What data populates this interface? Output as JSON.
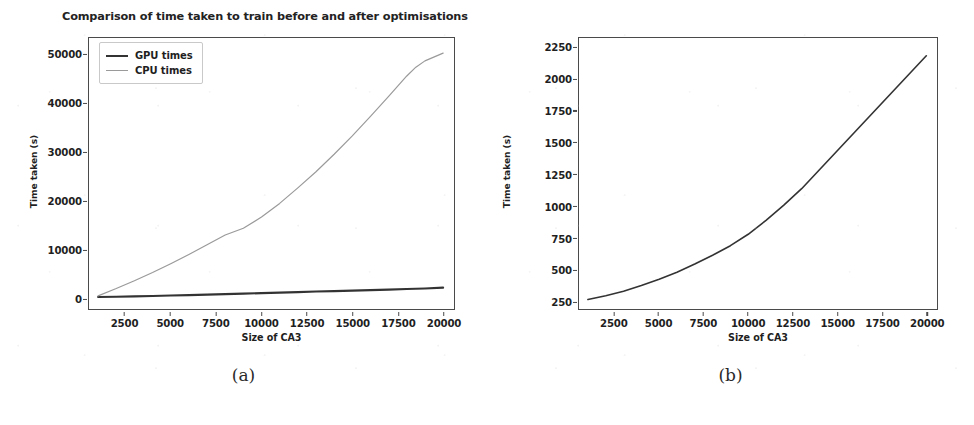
{
  "figure": {
    "background_color": "#ffffff",
    "captions": [
      {
        "id": "a",
        "text": "(a)"
      },
      {
        "id": "b",
        "text": "(b)"
      }
    ]
  },
  "colors": {
    "gpu_line": "#333333",
    "cpu_line": "#9a9a9a",
    "axis": "#4a4a4a",
    "text": "#1f1f1f"
  },
  "chart_data": [
    {
      "panel": "a",
      "type": "line",
      "title": "Comparison of time taken to train before and after optimisations",
      "xlabel": "Size of CA3",
      "ylabel": "Time taken (s)",
      "xlim": [
        500,
        20600
      ],
      "ylim": [
        -2200,
        53500
      ],
      "xticks": [
        2500,
        5000,
        7500,
        10000,
        12500,
        15000,
        17500,
        20000
      ],
      "yticks": [
        0,
        10000,
        20000,
        30000,
        40000,
        50000
      ],
      "xticklabels": [
        "2500",
        "5000",
        "7500",
        "10000",
        "12500",
        "15000",
        "17500",
        "20000"
      ],
      "yticklabels": [
        "0",
        "10000",
        "20000",
        "30000",
        "40000",
        "50000"
      ],
      "grid": false,
      "legend_position": "upper left",
      "x": [
        1000,
        2000,
        3000,
        4000,
        5000,
        6000,
        7000,
        8000,
        9000,
        10000,
        11000,
        12000,
        13000,
        14000,
        15000,
        16000,
        17000,
        18000,
        18500,
        19000,
        20000
      ],
      "series": [
        {
          "name": "GPU times",
          "color": "#333333",
          "linewidth": 2.1,
          "values": [
            260,
            330,
            400,
            470,
            560,
            650,
            750,
            860,
            960,
            1060,
            1170,
            1270,
            1380,
            1480,
            1580,
            1680,
            1790,
            1900,
            1950,
            2020,
            2190
          ]
        },
        {
          "name": "CPU times",
          "color": "#9a9a9a",
          "linewidth": 1.2,
          "values": [
            500,
            2000,
            3600,
            5300,
            7100,
            9000,
            11000,
            13000,
            14400,
            16700,
            19500,
            22700,
            26000,
            29600,
            33400,
            37400,
            41500,
            45700,
            47500,
            48800,
            50400
          ]
        }
      ]
    },
    {
      "panel": "b",
      "type": "line",
      "title": "",
      "xlabel": "Size of CA3",
      "ylabel": "Time taken (s)",
      "xlim": [
        500,
        20600
      ],
      "ylim": [
        190,
        2330
      ],
      "xticks": [
        2500,
        5000,
        7500,
        10000,
        12500,
        15000,
        17500,
        20000
      ],
      "yticks": [
        250,
        500,
        750,
        1000,
        1250,
        1500,
        1750,
        2000,
        2250
      ],
      "xticklabels": [
        "2500",
        "5000",
        "7500",
        "10000",
        "12500",
        "15000",
        "17500",
        "20000"
      ],
      "yticklabels": [
        "250",
        "500",
        "750",
        "1000",
        "1250",
        "1500",
        "1750",
        "2000",
        "2250"
      ],
      "grid": false,
      "legend_position": "none",
      "x": [
        1000,
        2000,
        3000,
        4000,
        5000,
        6000,
        7000,
        8000,
        9000,
        10000,
        11000,
        12000,
        13000,
        14000,
        15000,
        16000,
        17000,
        18000,
        19000,
        20000
      ],
      "series": [
        {
          "name": "GPU times",
          "color": "#333333",
          "linewidth": 1.6,
          "values": [
            265,
            295,
            330,
            375,
            425,
            480,
            545,
            615,
            690,
            780,
            890,
            1010,
            1140,
            1290,
            1440,
            1590,
            1740,
            1890,
            2040,
            2190
          ]
        }
      ]
    }
  ],
  "legend": {
    "items": [
      {
        "label": "GPU times",
        "key": "gpu"
      },
      {
        "label": "CPU times",
        "key": "cpu"
      }
    ]
  }
}
